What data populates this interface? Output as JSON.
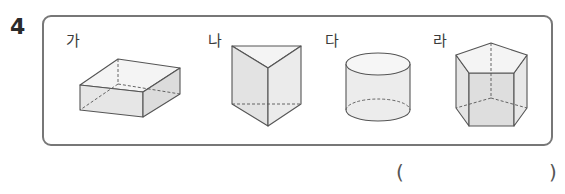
{
  "problem": {
    "number": "4",
    "options": [
      {
        "label": "가",
        "shape": "rectangular-prism"
      },
      {
        "label": "나",
        "shape": "triangular-prism"
      },
      {
        "label": "다",
        "shape": "cylinder"
      },
      {
        "label": "라",
        "shape": "pentagonal-prism"
      }
    ],
    "answer": {
      "open_paren": "(",
      "close_paren": ")",
      "value": ""
    }
  },
  "colors": {
    "box_border": "#777777",
    "edge": "#555555",
    "face_fill": "#e9e9e9",
    "face_fill_light": "#f3f3f3"
  }
}
